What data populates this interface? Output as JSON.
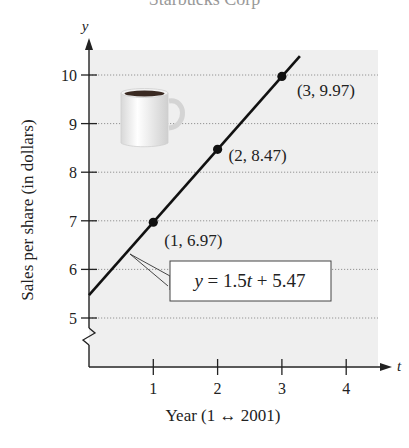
{
  "chart_data": {
    "type": "line",
    "title": "Starbucks Corp",
    "xlabel": "Year (1 ↔ 2001)",
    "ylabel": "Sales per share (in dollars)",
    "x_axis_symbol": "t",
    "y_axis_symbol": "y",
    "x_ticks": [
      "1",
      "2",
      "3",
      "4"
    ],
    "y_ticks": [
      "5",
      "6",
      "7",
      "8",
      "9",
      "10"
    ],
    "xlim": [
      0,
      4.6
    ],
    "ylim": [
      4.0,
      10.6
    ],
    "grid": "horizontal dotted",
    "axis_break": "zigzag on y-axis below 5",
    "series": [
      {
        "name": "Sales per share",
        "points": [
          {
            "x": 1,
            "y": 6.97,
            "label": "(1, 6.97)"
          },
          {
            "x": 2,
            "y": 8.47,
            "label": "(2, 8.47)"
          },
          {
            "x": 3,
            "y": 9.97,
            "label": "(3, 9.97)"
          }
        ]
      }
    ],
    "fit_line": {
      "slope": 1.5,
      "intercept": 5.47,
      "label": "y = 1.5t + 5.47",
      "x_range": [
        0,
        3.3
      ]
    },
    "decoration": "coffee-mug illustration"
  },
  "labels": {
    "title_partial": "Starbucks Corp",
    "equation_y": "y",
    "equation_eq": " = 1.5",
    "equation_t": "t",
    "equation_rest": " + 5.47"
  }
}
